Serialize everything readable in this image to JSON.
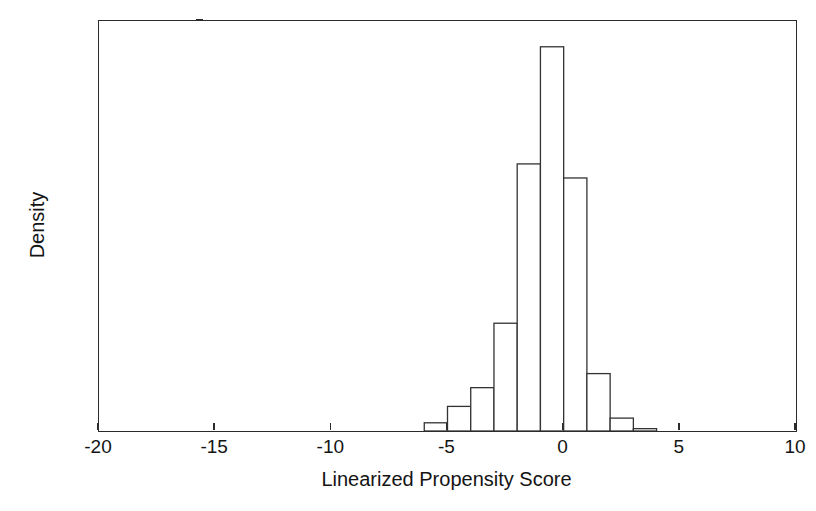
{
  "chart_data": {
    "type": "bar",
    "subtype": "histogram",
    "title": "",
    "xlabel": "Linearized Propensity Score",
    "ylabel": "Density",
    "xlim": [
      -20,
      10
    ],
    "ylim": [
      0,
      0.35
    ],
    "xticks": [
      -20,
      -15,
      -10,
      -5,
      0,
      5,
      10
    ],
    "xtick_labels": [
      "-20",
      "-15",
      "-10",
      "-5",
      "0",
      "5",
      "10"
    ],
    "yticks": [
      0,
      0.05,
      0.1,
      0.15,
      0.2,
      0.25,
      0.3,
      0.35
    ],
    "ytick_labels": [
      "0",
      "0.05",
      "0.1",
      "0.15",
      "0.2",
      "0.25",
      "0.3",
      "0.35"
    ],
    "grid": false,
    "legend": null,
    "bin_width": 1,
    "bin_edges": [
      -6,
      -5,
      -4,
      -3,
      -2,
      -1,
      0,
      1,
      2,
      3,
      4
    ],
    "categories": [
      "-6 to -5",
      "-5 to -4",
      "-4 to -3",
      "-3 to -2",
      "-2 to -1",
      "-1 to 0",
      "0 to 1",
      "1 to 2",
      "2 to 3",
      "3 to 4"
    ],
    "x": [
      -5.5,
      -4.5,
      -3.5,
      -2.5,
      -1.5,
      -0.5,
      0.5,
      1.5,
      2.5,
      3.5
    ],
    "values": [
      0.007,
      0.021,
      0.037,
      0.092,
      0.228,
      0.328,
      0.216,
      0.049,
      0.011,
      0.002
    ],
    "bar_color": "#ffffff",
    "bar_edge_color": "#333333",
    "axis_color": "#2b2b2b",
    "background_color": "#ffffff"
  }
}
